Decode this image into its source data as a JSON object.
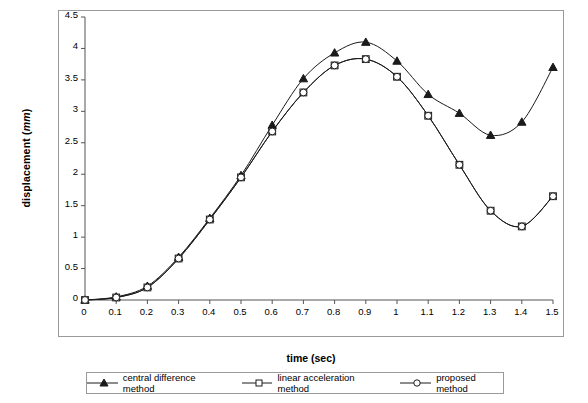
{
  "chart_data": {
    "type": "line",
    "title": "",
    "xlabel": "time (sec)",
    "ylabel_text": "displacement (",
    "ylabel_unit": "mm",
    "ylabel_tail": ")",
    "xlim": [
      0,
      1.5
    ],
    "ylim": [
      0,
      4.5
    ],
    "grid": false,
    "legend_position": "bottom",
    "xticks": [
      "0",
      "0.1",
      "0.2",
      "0.3",
      "0.4",
      "0.5",
      "0.6",
      "0.7",
      "0.8",
      "0.9",
      "1",
      "1.1",
      "1.2",
      "1.3",
      "1.4",
      "1.5"
    ],
    "yticks": [
      "0",
      "0.5",
      "1",
      "1.5",
      "2",
      "2.5",
      "3",
      "3.5",
      "4",
      "4.5"
    ],
    "x": [
      0,
      0.1,
      0.2,
      0.3,
      0.4,
      0.5,
      0.6,
      0.7,
      0.8,
      0.9,
      1.0,
      1.1,
      1.2,
      1.3,
      1.4,
      1.5
    ],
    "series": [
      {
        "name": "central difference method",
        "marker": "triangle",
        "values": [
          0.0,
          0.05,
          0.22,
          0.68,
          1.3,
          1.98,
          2.78,
          3.52,
          3.93,
          4.1,
          3.8,
          3.27,
          2.97,
          2.62,
          2.83,
          3.7
        ]
      },
      {
        "name": "linear acceleration method",
        "marker": "square",
        "values": [
          0.0,
          0.04,
          0.2,
          0.66,
          1.28,
          1.95,
          2.68,
          3.3,
          3.73,
          3.83,
          3.55,
          2.93,
          2.15,
          1.42,
          1.17,
          1.65
        ]
      },
      {
        "name": "proposed method",
        "marker": "circle",
        "values": [
          0.0,
          0.04,
          0.2,
          0.66,
          1.28,
          1.95,
          2.68,
          3.3,
          3.73,
          3.83,
          3.55,
          2.93,
          2.15,
          1.42,
          1.17,
          1.65
        ]
      }
    ]
  },
  "legend": {
    "items": [
      {
        "label": "central difference method"
      },
      {
        "label": "linear acceleration method"
      },
      {
        "label": "proposed method"
      }
    ]
  },
  "colors": {
    "line": "#1a1a1a",
    "frame": "#9a9a9a",
    "background": "#ffffff"
  }
}
